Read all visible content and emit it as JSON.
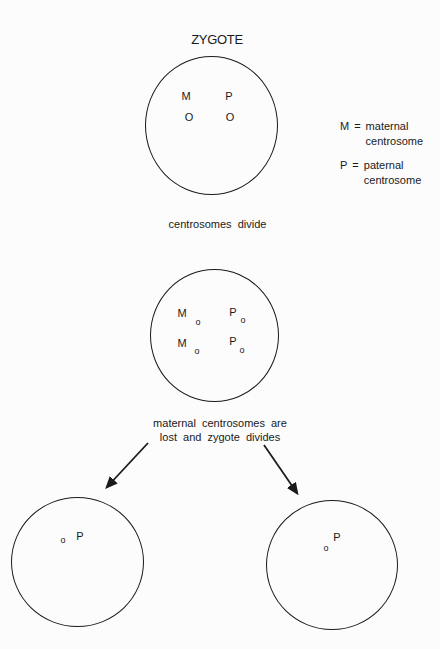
{
  "colors": {
    "ink": "#1a1a1a",
    "background": "#fcfcfc"
  },
  "title": "ZYGOTE",
  "legend": {
    "equals": "=",
    "entries": [
      {
        "symbol": "M",
        "definition_line1": "maternal",
        "definition_line2": "centrosome"
      },
      {
        "symbol": "P",
        "definition_line1": "paternal",
        "definition_line2": "centrosome"
      }
    ]
  },
  "stage1": {
    "maternal_label": "M",
    "maternal_marker": "O",
    "paternal_label": "P",
    "paternal_marker": "O",
    "caption": "centrosomes divide"
  },
  "stage2": {
    "maternal1_label": "M",
    "maternal1_marker": "o",
    "paternal1_label": "P",
    "paternal1_marker": "o",
    "maternal2_label": "M",
    "maternal2_marker": "o",
    "paternal2_label": "P",
    "paternal2_marker": "o",
    "caption_line1": "maternal centrosomes are",
    "caption_line2": "lost and zygote divides"
  },
  "daughters": {
    "left": {
      "marker": "o",
      "label": "P"
    },
    "right": {
      "label": "P",
      "marker": "o"
    }
  }
}
